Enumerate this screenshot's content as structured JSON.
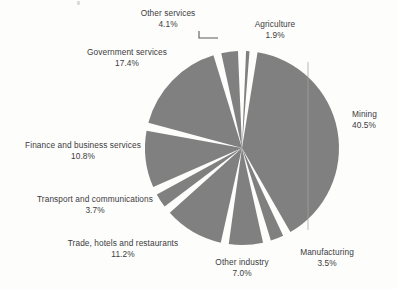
{
  "chart_data": {
    "type": "pie",
    "title": "",
    "subtitle": "",
    "xlabel": "",
    "ylabel": "",
    "legend_position": "none",
    "grid": false,
    "label_format": "name + percent",
    "units": "percent",
    "slice_color": "#808080",
    "background": "#fdfdfc",
    "text_color": "#3c3c3c",
    "exploded": true,
    "start_angle_deg": 0,
    "direction": "clockwise",
    "categories": [
      "Agriculture",
      "Mining",
      "Manufacturing",
      "Other industry",
      "Trade, hotels and restaurants",
      "Transport and communications",
      "Finance and business services",
      "Government services",
      "Other services"
    ],
    "values": [
      1.9,
      40.5,
      3.5,
      7.0,
      11.2,
      3.7,
      10.8,
      17.4,
      4.1
    ],
    "value_labels": [
      "1.9%",
      "40.5%",
      "3.5%",
      "7.0%",
      "11.2%",
      "3.7%",
      "10.8%",
      "17.4%",
      "4.1%"
    ],
    "total": 100.1,
    "slices": [
      {
        "label": "Agriculture",
        "percent_label": "1.9%",
        "value": 1.9
      },
      {
        "label": "Mining",
        "percent_label": "40.5%",
        "value": 40.5
      },
      {
        "label": "Manufacturing",
        "percent_label": "3.5%",
        "value": 3.5
      },
      {
        "label": "Other industry",
        "percent_label": "7.0%",
        "value": 7.0
      },
      {
        "label": "Trade, hotels and restaurants",
        "percent_label": "11.2%",
        "value": 11.2
      },
      {
        "label": "Transport and communications",
        "percent_label": "3.7%",
        "value": 3.7
      },
      {
        "label": "Finance and business services",
        "percent_label": "10.8%",
        "value": 10.8
      },
      {
        "label": "Government services",
        "percent_label": "17.4%",
        "value": 17.4
      },
      {
        "label": "Other services",
        "percent_label": "4.1%",
        "value": 4.1
      }
    ]
  },
  "callouts": {
    "other_services": {
      "name": "Other services",
      "pct": "4.1%"
    },
    "agriculture": {
      "name": "Agriculture",
      "pct": "1.9%"
    },
    "mining": {
      "name": "Mining",
      "pct": "40.5%"
    },
    "manufacturing": {
      "name": "Manufacturing",
      "pct": "3.5%"
    },
    "other_industry": {
      "name": "Other industry",
      "pct": "7.0%"
    },
    "trade": {
      "name": "Trade, hotels and restaurants",
      "pct": "11.2%"
    },
    "transport": {
      "name": "Transport and communications",
      "pct": "3.7%"
    },
    "finance": {
      "name": "Finance and business services",
      "pct": "10.8%"
    },
    "government": {
      "name": "Government services",
      "pct": "17.4%"
    }
  }
}
